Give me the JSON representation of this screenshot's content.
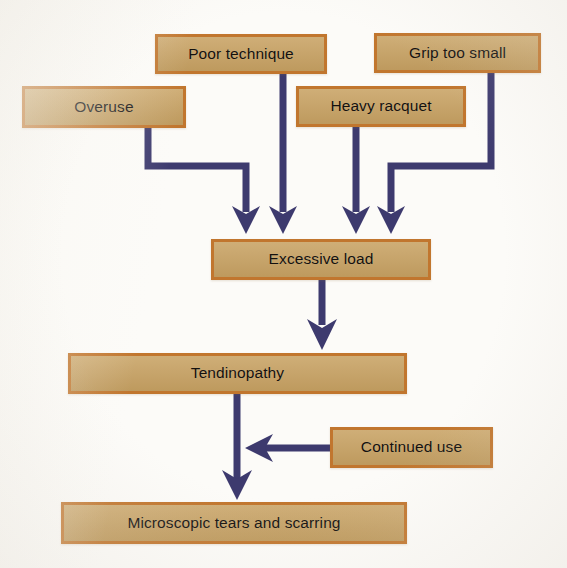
{
  "diagram": {
    "background_color": "#fcfbf8",
    "node_fill_color": "#c8a263",
    "node_border_color": "#c1762e",
    "arrow_color": "#3d3a6e"
  },
  "nodes": [
    {
      "id": "overuse",
      "label": "Overuse",
      "row": "causes",
      "x": 22,
      "y": 86,
      "w": 164,
      "h": 42
    },
    {
      "id": "poor",
      "label": "Poor technique",
      "row": "causes",
      "x": 155,
      "y": 34,
      "w": 172,
      "h": 40
    },
    {
      "id": "heavy",
      "label": "Heavy racquet",
      "row": "causes",
      "x": 296,
      "y": 86,
      "w": 170,
      "h": 41
    },
    {
      "id": "grip",
      "label": "Grip too small",
      "row": "causes",
      "x": 374,
      "y": 33,
      "w": 167,
      "h": 40
    },
    {
      "id": "excessive",
      "label": "Excessive load",
      "row": "stage-1",
      "x": 211,
      "y": 239,
      "w": 220,
      "h": 41
    },
    {
      "id": "tendinopathy",
      "label": "Tendinopathy",
      "row": "stage-2",
      "x": 68,
      "y": 353,
      "w": 339,
      "h": 41
    },
    {
      "id": "continued",
      "label": "Continued use",
      "row": "modifier",
      "x": 330,
      "y": 427,
      "w": 163,
      "h": 41
    },
    {
      "id": "micro",
      "label": "Microscopic tears and scarring",
      "row": "stage-3",
      "x": 61,
      "y": 502,
      "w": 346,
      "h": 42
    }
  ],
  "edges": [
    {
      "id": "overuse-to-excessive",
      "from": "overuse",
      "to": "excessive",
      "style": "elbow-right-down",
      "arrowhead": "down"
    },
    {
      "id": "poor-to-excessive",
      "from": "poor",
      "to": "excessive",
      "style": "straight-down",
      "arrowhead": "down"
    },
    {
      "id": "heavy-to-excessive",
      "from": "heavy",
      "to": "excessive",
      "style": "straight-down",
      "arrowhead": "down"
    },
    {
      "id": "grip-to-excessive",
      "from": "grip",
      "to": "excessive",
      "style": "elbow-left-down",
      "arrowhead": "down"
    },
    {
      "id": "excessive-to-tendinopathy",
      "from": "excessive",
      "to": "tendinopathy",
      "style": "straight-down",
      "arrowhead": "down"
    },
    {
      "id": "tendinopathy-to-micro",
      "from": "tendinopathy",
      "to": "micro",
      "style": "straight-down",
      "arrowhead": "down"
    },
    {
      "id": "continued-to-pathway",
      "from": "continued",
      "to": "tendinopathy-to-micro",
      "style": "straight-left",
      "arrowhead": "left"
    }
  ]
}
